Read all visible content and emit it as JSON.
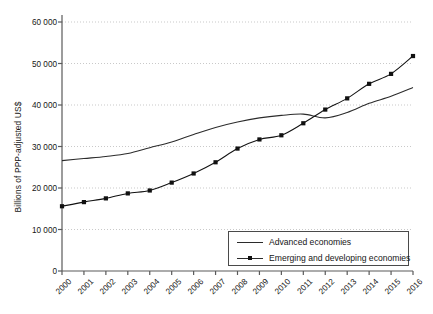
{
  "chart_data": {
    "type": "line",
    "title": "",
    "xlabel": "",
    "ylabel": "Billions of PPP-adjusted US$",
    "x": [
      2000,
      2001,
      2002,
      2003,
      2004,
      2005,
      2006,
      2007,
      2008,
      2009,
      2010,
      2011,
      2012,
      2013,
      2014,
      2015,
      2016
    ],
    "categories": [
      "2000",
      "2001",
      "2002",
      "2003",
      "2004",
      "2005",
      "2006",
      "2007",
      "2008",
      "2009",
      "2010",
      "2011",
      "2012",
      "2013",
      "2014",
      "2015",
      "2016"
    ],
    "xlim": [
      2000,
      2016
    ],
    "ylim": [
      0,
      60000
    ],
    "yticks": [
      0,
      10000,
      20000,
      30000,
      40000,
      50000,
      60000
    ],
    "ytick_labels": [
      "0",
      "10 000",
      "20 000",
      "30 000",
      "40 000",
      "50 000",
      "60 000"
    ],
    "grid": true,
    "grid_axis": "y",
    "legend_position": "bottom-right",
    "series": [
      {
        "name": "Advanced economies",
        "marker": "none",
        "color": "#2b2b2b",
        "values": [
          26600,
          27100,
          27600,
          28300,
          29700,
          31100,
          32900,
          34600,
          35900,
          36900,
          37500,
          37800,
          36900,
          38200,
          40400,
          42100,
          44200
        ]
      },
      {
        "name": "Emerging and developing economies",
        "marker": "square",
        "color": "#111111",
        "values": [
          15600,
          16600,
          17500,
          18700,
          19400,
          21300,
          23500,
          26200,
          29500,
          31700,
          32700,
          35600,
          38900,
          41600,
          45100,
          47500,
          51800
        ]
      }
    ]
  },
  "legend": {
    "items": [
      {
        "label": "Advanced economies",
        "marker": "none"
      },
      {
        "label": "Emerging and developing economies",
        "marker": "square"
      }
    ]
  },
  "axis": {
    "y_title": "Billions of PPP-adjusted US$"
  }
}
